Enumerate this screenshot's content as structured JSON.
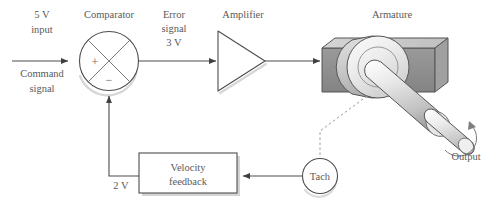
{
  "diagram": {
    "background_color": "#ffffff",
    "line_color": "#4d4d4d",
    "text_color": "#5a5a5a",
    "labels": {
      "input_voltage": "5 V",
      "input_word": "input",
      "command": "Command",
      "command_signal": "signal",
      "comparator": "Comparator",
      "plus_sign": "+",
      "minus_sign": "−",
      "error": "Error",
      "error_signal": "signal",
      "error_voltage": "3 V",
      "amplifier": "Amplifier",
      "armature": "Armature",
      "output": "Output",
      "tach": "Tach",
      "velocity": "Velocity",
      "feedback": "feedback",
      "feedback_voltage": "2 V"
    },
    "blocks": [
      {
        "name": "comparator",
        "shape": "circle-with-x",
        "label": "Comparator"
      },
      {
        "name": "amplifier",
        "shape": "triangle",
        "label": "Amplifier"
      },
      {
        "name": "armature",
        "shape": "3d-motor",
        "label": "Armature"
      },
      {
        "name": "tach",
        "shape": "circle",
        "label": "Tach"
      },
      {
        "name": "velocity-feedback",
        "shape": "rectangle",
        "label": "Velocity feedback"
      }
    ],
    "signals": [
      {
        "name": "command-input",
        "value": "5 V",
        "from": "input",
        "to": "comparator"
      },
      {
        "name": "error-signal",
        "value": "3 V",
        "from": "comparator",
        "to": "amplifier"
      },
      {
        "name": "feedback-signal",
        "value": "2 V",
        "from": "velocity-feedback",
        "to": "comparator"
      }
    ],
    "colors": {
      "block_face_dark": "#8e8e8e",
      "block_face_top": "#c9c9c9",
      "block_face_side": "#a8a8a8",
      "rotor_light": "#e8e8e8",
      "shaft_light": "#f0f0f0",
      "shadow": "#b5b5b5"
    }
  }
}
